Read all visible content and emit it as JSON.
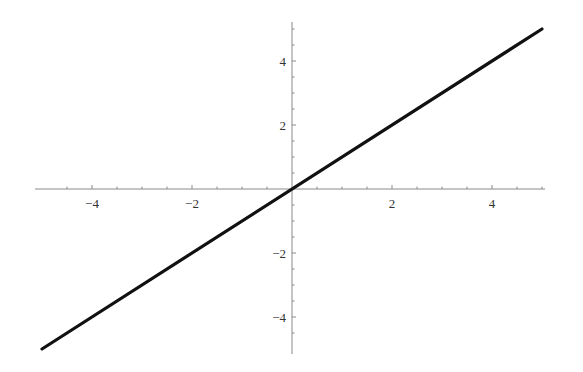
{
  "chart_data": {
    "type": "line",
    "title": "",
    "xlabel": "",
    "ylabel": "",
    "xlim": [
      -5,
      5
    ],
    "ylim": [
      -5,
      5
    ],
    "grid": false,
    "legend": null,
    "x_ticks": [
      -4,
      -2,
      2,
      4
    ],
    "y_ticks": [
      -4,
      -2,
      2,
      4
    ],
    "x_tick_labels": [
      "−4",
      "−2",
      "2",
      "4"
    ],
    "y_tick_labels": [
      "−4",
      "−2",
      "2",
      "4"
    ],
    "minor_tick_step": 0.5,
    "series": [
      {
        "name": "y = x",
        "color": "#111111",
        "x": [
          -5,
          5
        ],
        "y": [
          -5,
          5
        ]
      }
    ]
  },
  "colors": {
    "axis": "#8a8a8a",
    "line": "#111111",
    "label": "#333333",
    "background": "#ffffff"
  }
}
